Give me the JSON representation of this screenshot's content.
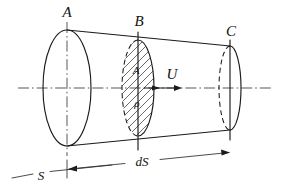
{
  "figure": {
    "labels": {
      "left_section": "A",
      "mid_section": "B",
      "right_section": "C",
      "area_symbol": "A",
      "density_symbol": "ρ",
      "velocity_symbol": "U",
      "surface_symbol": "S",
      "length_symbol": "dS"
    },
    "colors": {
      "ink": "#1a1a1a",
      "paper": "#ffffff",
      "hatch": "#2b2b2b"
    },
    "geometry": {
      "axis_y": 88,
      "left_ellipse": {
        "cx": 67,
        "cy": 88,
        "rx": 24,
        "ry": 58
      },
      "mid_ellipse": {
        "cx": 138,
        "cy": 88,
        "rx": 16,
        "ry": 48
      },
      "right_ellipse": {
        "cx": 230,
        "cy": 88,
        "rx": 11,
        "ry": 42
      },
      "dimension_line_label": "dS"
    }
  }
}
